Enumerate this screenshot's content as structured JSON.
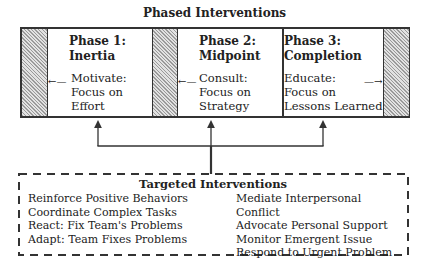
{
  "title": "Phased Interventions",
  "phases": [
    {
      "title_line1": "Phase 1:",
      "title_line2": "Inertia",
      "body_line1": "Motivate:",
      "body_line2": "Focus on",
      "body_line3": "Effort"
    },
    {
      "title_line1": "Phase 2:",
      "title_line2": "Midpoint",
      "body_line1": "Consult:",
      "body_line2": "Focus on",
      "body_line3": "Strategy"
    },
    {
      "title_line1": "Phase 3:",
      "title_line2": "Completion",
      "body_line1": "Educate:",
      "body_line2": "Focus on",
      "body_line3": "Lessons Learned"
    }
  ],
  "targeted": {
    "title": "Targeted Interventions",
    "left": [
      "Reinforce Positive Behaviors",
      "Coordinate Complex Tasks",
      "React: Fix Team's Problems",
      "Adapt: Team Fixes Problems"
    ],
    "right": [
      "Mediate Interpersonal Conflict",
      "Advocate Personal Support",
      "Monitor Emergent Issue",
      "Respond to Urgent Problem"
    ]
  },
  "colors": {
    "line": "#333333",
    "hatch_dark": "#9a9a9a",
    "hatch_light": "#e2e2e2"
  }
}
